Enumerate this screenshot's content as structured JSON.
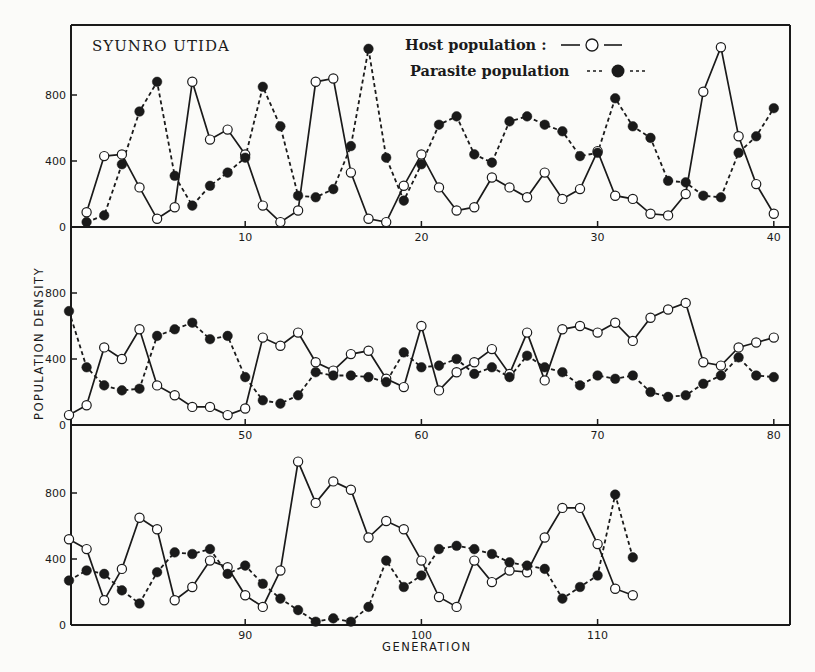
{
  "chart_data": {
    "type": "line",
    "title": "",
    "author_label": "SYUNRO UTIDA",
    "xlabel": "GENERATION",
    "ylabel": "POPULATION DENSITY",
    "legend": {
      "position": "top-right of first panel",
      "entries": [
        {
          "name": "Host population",
          "label": "Host population :",
          "style": "solid line, open circles"
        },
        {
          "name": "Parasite population",
          "label": "Parasite population",
          "style": "dashed line, filled circles"
        }
      ]
    },
    "grid": false,
    "colors": {
      "line": "#1a1a1a",
      "background": "#fbfbf9",
      "open_marker_fill": "#ffffff"
    },
    "panels": [
      {
        "x_range": [
          0,
          40
        ],
        "xticks": [
          10,
          20,
          30,
          40
        ],
        "ylim": [
          0,
          1200
        ],
        "yticks": [
          0,
          400,
          800
        ],
        "x": [
          1,
          2,
          3,
          4,
          5,
          6,
          7,
          8,
          9,
          10,
          11,
          12,
          13,
          14,
          15,
          16,
          17,
          18,
          19,
          20,
          21,
          22,
          23,
          24,
          25,
          26,
          27,
          28,
          29,
          30,
          31,
          32,
          33,
          34,
          35,
          36,
          37,
          38,
          39,
          40
        ],
        "series": [
          {
            "name": "Host population",
            "values": [
              90,
              430,
              440,
              240,
              50,
              120,
              880,
              530,
              590,
              440,
              130,
              30,
              100,
              880,
              900,
              330,
              50,
              30,
              250,
              440,
              240,
              100,
              120,
              300,
              240,
              180,
              330,
              170,
              230,
              460,
              190,
              170,
              80,
              70,
              200,
              820,
              1090,
              550,
              260,
              80
            ]
          },
          {
            "name": "Parasite population",
            "values": [
              30,
              70,
              380,
              700,
              880,
              310,
              130,
              250,
              330,
              420,
              850,
              610,
              190,
              180,
              230,
              490,
              1080,
              420,
              160,
              380,
              620,
              670,
              440,
              390,
              640,
              670,
              620,
              580,
              430,
              450,
              780,
              610,
              540,
              280,
              270,
              190,
              180,
              450,
              550,
              720
            ]
          }
        ]
      },
      {
        "x_range": [
          40,
          80
        ],
        "xticks": [
          50,
          60,
          70,
          80
        ],
        "ylim": [
          0,
          1200
        ],
        "yticks": [
          0,
          400,
          800
        ],
        "x": [
          40,
          41,
          42,
          43,
          44,
          45,
          46,
          47,
          48,
          49,
          50,
          51,
          52,
          53,
          54,
          55,
          56,
          57,
          58,
          59,
          60,
          61,
          62,
          63,
          64,
          65,
          66,
          67,
          68,
          69,
          70,
          71,
          72,
          73,
          74,
          75,
          76,
          77,
          78,
          79,
          80
        ],
        "series": [
          {
            "name": "Host population",
            "values": [
              60,
              120,
              470,
              400,
              580,
              240,
              180,
              110,
              110,
              60,
              100,
              530,
              480,
              560,
              380,
              330,
              430,
              450,
              280,
              230,
              600,
              210,
              320,
              380,
              460,
              310,
              560,
              270,
              580,
              600,
              560,
              620,
              510,
              650,
              700,
              740,
              380,
              360,
              470,
              500,
              530
            ]
          },
          {
            "name": "Parasite population",
            "values": [
              690,
              350,
              240,
              210,
              220,
              540,
              580,
              620,
              520,
              540,
              290,
              150,
              130,
              180,
              320,
              300,
              300,
              290,
              260,
              440,
              350,
              360,
              400,
              310,
              350,
              290,
              420,
              350,
              320,
              240,
              300,
              280,
              300,
              200,
              170,
              180,
              250,
              300,
              410,
              300,
              290
            ]
          }
        ]
      },
      {
        "x_range": [
          80,
          120
        ],
        "xticks": [
          90,
          100,
          110
        ],
        "ylim": [
          0,
          1200
        ],
        "yticks": [
          0,
          400,
          800
        ],
        "x": [
          80,
          81,
          82,
          83,
          84,
          85,
          86,
          87,
          88,
          89,
          90,
          91,
          92,
          93,
          94,
          95,
          96,
          97,
          98,
          99,
          100,
          101,
          102,
          103,
          104,
          105,
          106,
          107,
          108,
          109,
          110,
          111,
          112
        ],
        "series": [
          {
            "name": "Host population",
            "values": [
              520,
              460,
              150,
              340,
              650,
              580,
              150,
              230,
              390,
              350,
              180,
              110,
              330,
              990,
              740,
              870,
              820,
              530,
              630,
              580,
              390,
              170,
              110,
              390,
              260,
              330,
              320,
              530,
              710,
              710,
              490,
              220,
              180
            ]
          },
          {
            "name": "Parasite population",
            "values": [
              270,
              330,
              310,
              210,
              130,
              320,
              440,
              430,
              460,
              310,
              360,
              250,
              160,
              90,
              20,
              40,
              20,
              110,
              390,
              230,
              300,
              460,
              480,
              460,
              430,
              380,
              360,
              340,
              160,
              230,
              300,
              790,
              410
            ]
          }
        ]
      }
    ]
  }
}
